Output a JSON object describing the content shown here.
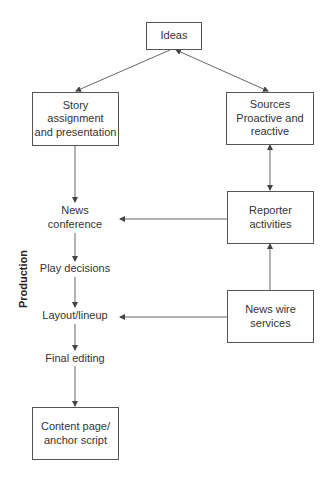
{
  "nodes": {
    "ideas": "Ideas",
    "story": "Story\nassignment\nand presentation",
    "sources": "Sources\nProactive and\nreactive",
    "reporter": "Reporter\nactivities",
    "newswire": "News wire\nservices",
    "content": "Content page/\nanchor script"
  },
  "steps": {
    "news_conference": "News\nconference",
    "play_decisions": "Play decisions",
    "layout_lineup": "Layout/lineup",
    "final_editing": "Final editing"
  },
  "side_label": "Production",
  "colors": {
    "line": "#555555",
    "text": "#333333",
    "background": "#ffffff"
  },
  "edges": [
    {
      "from": "ideas",
      "to": "story",
      "type": "arrow"
    },
    {
      "from": "ideas",
      "to": "sources",
      "type": "bidirectional"
    },
    {
      "from": "story",
      "to": "news_conference",
      "type": "arrow"
    },
    {
      "from": "sources",
      "to": "reporter",
      "type": "bidirectional"
    },
    {
      "from": "reporter",
      "to": "news_conference",
      "type": "arrow"
    },
    {
      "from": "newswire",
      "to": "reporter",
      "type": "arrow"
    },
    {
      "from": "newswire",
      "to": "layout_lineup",
      "type": "arrow"
    },
    {
      "from": "news_conference",
      "to": "play_decisions",
      "type": "arrow"
    },
    {
      "from": "play_decisions",
      "to": "layout_lineup",
      "type": "arrow"
    },
    {
      "from": "layout_lineup",
      "to": "final_editing",
      "type": "arrow"
    },
    {
      "from": "final_editing",
      "to": "content",
      "type": "arrow"
    }
  ]
}
